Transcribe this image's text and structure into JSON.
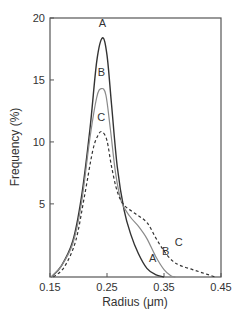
{
  "chart_data": {
    "type": "line",
    "title": "",
    "xlabel": "Radius (μm)",
    "ylabel": "Frequency (%)",
    "xlim": [
      0.15,
      0.45
    ],
    "ylim": [
      -0.9,
      20
    ],
    "grid": false,
    "legend": "inline labels on curves",
    "x_ticks": [
      {
        "value": 0.15,
        "label": "0.15"
      },
      {
        "value": 0.25,
        "label": "0.25"
      },
      {
        "value": 0.35,
        "label": "0.35"
      },
      {
        "value": 0.45,
        "label": "0.45"
      }
    ],
    "y_ticks": [
      {
        "value": 5,
        "label": "5"
      },
      {
        "value": 10,
        "label": "10"
      },
      {
        "value": 15,
        "label": "15"
      },
      {
        "value": 20,
        "label": "20"
      }
    ],
    "series": [
      {
        "name": "A",
        "style": "solid",
        "color": "#333333",
        "width": 1.4,
        "points": [
          [
            0.152,
            -0.9
          ],
          [
            0.17,
            0
          ],
          [
            0.19,
            2
          ],
          [
            0.205,
            5.5
          ],
          [
            0.22,
            11
          ],
          [
            0.232,
            16.5
          ],
          [
            0.242,
            18.4
          ],
          [
            0.25,
            17
          ],
          [
            0.258,
            13
          ],
          [
            0.268,
            8
          ],
          [
            0.28,
            4.5
          ],
          [
            0.292,
            2.5
          ],
          [
            0.305,
            1
          ],
          [
            0.32,
            -0.2
          ],
          [
            0.335,
            -0.7
          ],
          [
            0.35,
            -0.9
          ]
        ],
        "labels": [
          {
            "text": "A",
            "x": 0.242,
            "y": 19.3
          },
          {
            "text": "A",
            "x": 0.33,
            "y": 0.3
          }
        ]
      },
      {
        "name": "B",
        "style": "solid",
        "color": "#8a8a8a",
        "width": 1.2,
        "points": [
          [
            0.152,
            -0.9
          ],
          [
            0.17,
            0
          ],
          [
            0.19,
            1.8
          ],
          [
            0.205,
            5
          ],
          [
            0.22,
            10.3
          ],
          [
            0.232,
            13.6
          ],
          [
            0.24,
            14.3
          ],
          [
            0.248,
            13.8
          ],
          [
            0.256,
            11
          ],
          [
            0.265,
            7.5
          ],
          [
            0.275,
            5.2
          ],
          [
            0.29,
            4
          ],
          [
            0.305,
            3.2
          ],
          [
            0.32,
            2.2
          ],
          [
            0.335,
            0.8
          ],
          [
            0.35,
            -0.3
          ],
          [
            0.362,
            -0.8
          ],
          [
            0.37,
            -0.9
          ]
        ],
        "labels": [
          {
            "text": "B",
            "x": 0.24,
            "y": 15.3
          },
          {
            "text": "B",
            "x": 0.353,
            "y": 0.9
          }
        ]
      },
      {
        "name": "C",
        "style": "dashed",
        "color": "#333333",
        "width": 1.2,
        "points": [
          [
            0.156,
            -0.9
          ],
          [
            0.175,
            -0.1
          ],
          [
            0.195,
            2
          ],
          [
            0.21,
            5.5
          ],
          [
            0.225,
            9.3
          ],
          [
            0.235,
            10.6
          ],
          [
            0.242,
            10.8
          ],
          [
            0.25,
            10.1
          ],
          [
            0.258,
            8
          ],
          [
            0.268,
            6
          ],
          [
            0.28,
            4.9
          ],
          [
            0.3,
            4.2
          ],
          [
            0.32,
            3.5
          ],
          [
            0.335,
            2.3
          ],
          [
            0.35,
            1.2
          ],
          [
            0.365,
            0.4
          ],
          [
            0.38,
            0
          ],
          [
            0.4,
            -0.3
          ],
          [
            0.42,
            -0.6
          ],
          [
            0.44,
            -0.9
          ]
        ],
        "labels": [
          {
            "text": "C",
            "x": 0.24,
            "y": 11.7
          },
          {
            "text": "C",
            "x": 0.376,
            "y": 1.6
          }
        ]
      }
    ]
  }
}
